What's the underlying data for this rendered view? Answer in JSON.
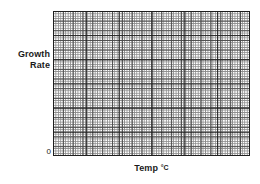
{
  "figure": {
    "name": "blank-growth-rate-vs-temperature-graph",
    "background_color": "#ffffff"
  },
  "axes": {
    "y": {
      "label_line1": "Growth",
      "label_line2": "Rate",
      "origin_label": "0"
    },
    "x": {
      "label_text": "Temp ",
      "label_unit": "°C"
    }
  },
  "grid": {
    "minor_color": "#8c8c8c",
    "medium_color": "#4d4d4d",
    "major_color": "#1f1f1f",
    "frame_color": "#1f1f1f"
  },
  "chart_data": {
    "type": "line",
    "title": "",
    "subtitle": "",
    "xlabel": "Temp °C",
    "ylabel": "Growth Rate",
    "x": [],
    "series": [],
    "values": [],
    "categories": [],
    "xlim": [
      0,
      null
    ],
    "ylim": [
      0,
      null
    ],
    "xticks": [],
    "yticks": [],
    "xticklabels": [],
    "yticklabels": [
      "0"
    ],
    "grid": true,
    "grid_style": "graph-paper",
    "grid_minor_cells_x": 80,
    "grid_minor_cells_y": 60,
    "grid_major_every_x": 4,
    "grid_major_every_y": 4,
    "legend": null,
    "legend_position": "none",
    "annotations": [],
    "note": "Empty graph-paper axes with no plotted data; only axis labels and a zero at the origin are printed."
  }
}
